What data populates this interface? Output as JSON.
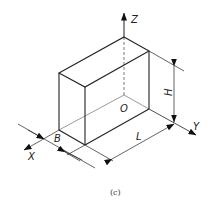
{
  "figure": {
    "caption": "(c)",
    "type": "isometric view of rectangular prism with dimensions"
  },
  "axes": {
    "x_label": "X",
    "y_label": "Y",
    "z_label": "Z",
    "origin_label": "O"
  },
  "dimensions": {
    "length_label": "L",
    "width_label": "B",
    "height_label": "H"
  },
  "colors": {
    "line": "#222222",
    "background": "#ffffff"
  }
}
